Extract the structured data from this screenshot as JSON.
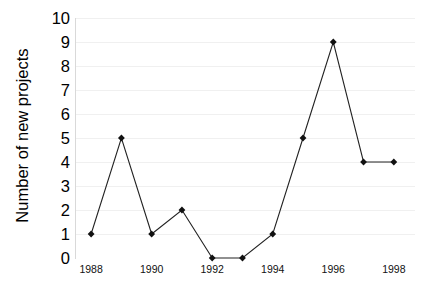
{
  "chart_data": {
    "type": "line",
    "title": "",
    "subtitle": "",
    "xlabel": "",
    "ylabel": "Number of new projects",
    "x": [
      1988,
      1989,
      1990,
      1991,
      1992,
      1993,
      1994,
      1995,
      1996,
      1997,
      1998
    ],
    "values": [
      1,
      5,
      1,
      2,
      0,
      0,
      1,
      5,
      9,
      4,
      4
    ],
    "series": [
      {
        "name": "Number of new projects",
        "values": [
          1,
          5,
          1,
          2,
          0,
          0,
          1,
          5,
          9,
          4,
          4
        ]
      }
    ],
    "xlim": [
      1987.5,
      1998.7
    ],
    "ylim": [
      0,
      10
    ],
    "y_ticks": [
      0,
      1,
      2,
      3,
      4,
      5,
      6,
      7,
      8,
      9,
      10
    ],
    "y_tick_labels": [
      "0",
      "1",
      "2",
      "3",
      "4",
      "5",
      "6",
      "7",
      "8",
      "9",
      "10"
    ],
    "x_ticks": [
      1988,
      1990,
      1992,
      1994,
      1996,
      1998
    ],
    "x_tick_labels": [
      "1988",
      "1990",
      "1992",
      "1994",
      "1996",
      "1998"
    ],
    "grid": true,
    "grid_axis": "y",
    "legend": false,
    "legend_position": "none",
    "marker": "diamond",
    "line_color": "#222222",
    "marker_color": "#111111",
    "grid_color": "#f0f0f0",
    "axis_color": "#d9d9d9",
    "background_color": "#ffffff"
  }
}
